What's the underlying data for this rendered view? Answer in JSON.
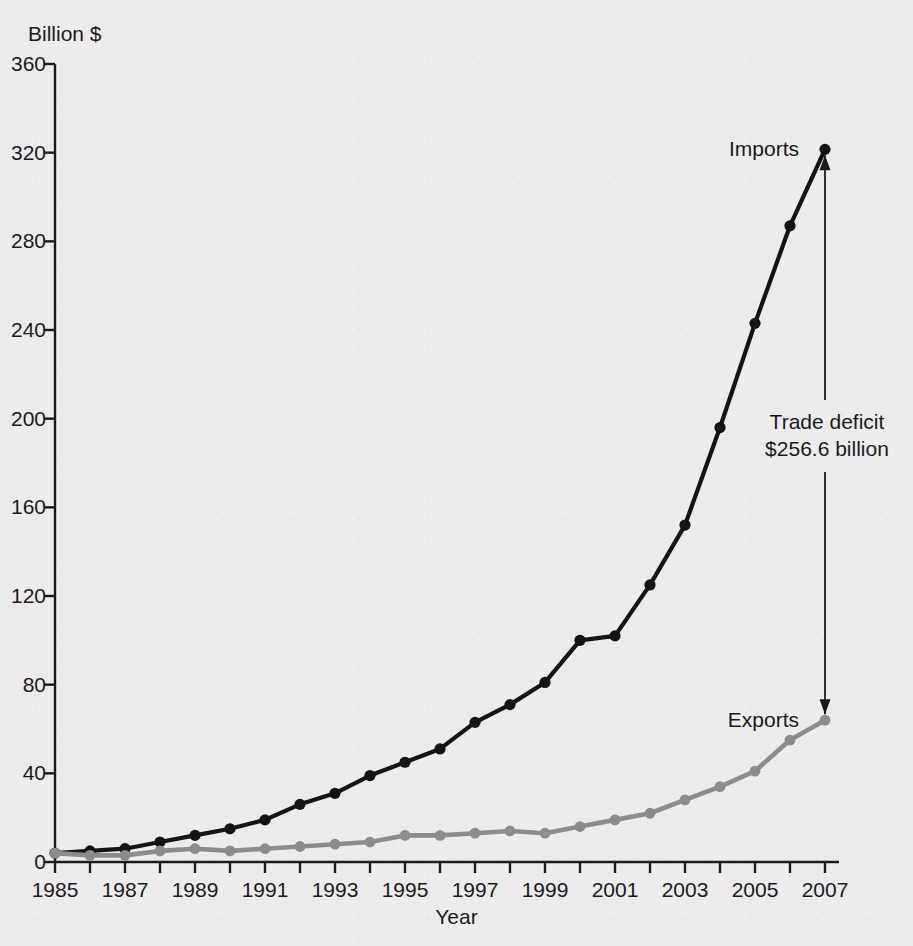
{
  "figure": {
    "background_color": "#ececec",
    "y_axis_unit_label": "Billion $",
    "x_axis_title": "Year",
    "imports_color": "#141414",
    "exports_color": "#8c8c8c"
  },
  "labels": {
    "imports": "Imports",
    "exports": "Exports",
    "deficit_line1": "Trade deficit",
    "deficit_line2": "$256.6 billion"
  },
  "chart_data": {
    "type": "line",
    "title": "",
    "xlabel": "Year",
    "ylabel": "Billion $",
    "xlim": [
      1985,
      2007
    ],
    "ylim": [
      0,
      360
    ],
    "ytick_labels": [
      "0",
      "40",
      "80",
      "120",
      "160",
      "200",
      "240",
      "280",
      "320",
      "360"
    ],
    "yticks": [
      0,
      40,
      80,
      120,
      160,
      200,
      240,
      280,
      320,
      360
    ],
    "xticks": [
      1985,
      1986,
      1987,
      1988,
      1989,
      1990,
      1991,
      1992,
      1993,
      1994,
      1995,
      1996,
      1997,
      1998,
      1999,
      2000,
      2001,
      2002,
      2003,
      2004,
      2005,
      2006,
      2007
    ],
    "xtick_labels": [
      "1985",
      "",
      "1987",
      "",
      "1989",
      "",
      "1991",
      "",
      "1993",
      "",
      "1995",
      "",
      "1997",
      "",
      "1999",
      "",
      "2001",
      "",
      "2003",
      "",
      "2005",
      "",
      "2007"
    ],
    "grid": false,
    "legend_position": "inline-end-labels",
    "x": [
      1985,
      1986,
      1987,
      1988,
      1989,
      1990,
      1991,
      1992,
      1993,
      1994,
      1995,
      1996,
      1997,
      1998,
      1999,
      2000,
      2001,
      2002,
      2003,
      2004,
      2005,
      2006,
      2007
    ],
    "series": [
      {
        "name": "Imports",
        "color": "#141414",
        "values": [
          4,
          5,
          6,
          9,
          12,
          15,
          19,
          26,
          31,
          39,
          45,
          51,
          63,
          71,
          81,
          100,
          102,
          125,
          152,
          196,
          243,
          287,
          321.5
        ]
      },
      {
        "name": "Exports",
        "color": "#8c8c8c",
        "values": [
          4,
          3,
          3,
          5,
          6,
          5,
          6,
          7,
          8,
          9,
          12,
          12,
          13,
          14,
          13,
          16,
          19,
          22,
          28,
          34,
          41,
          55,
          64
        ]
      }
    ],
    "annotations": [
      {
        "name": "trade-deficit",
        "text": "Trade deficit $256.6 billion",
        "value": 256.6,
        "year": 2007,
        "from_series": "Imports",
        "to_series": "Exports"
      }
    ]
  }
}
